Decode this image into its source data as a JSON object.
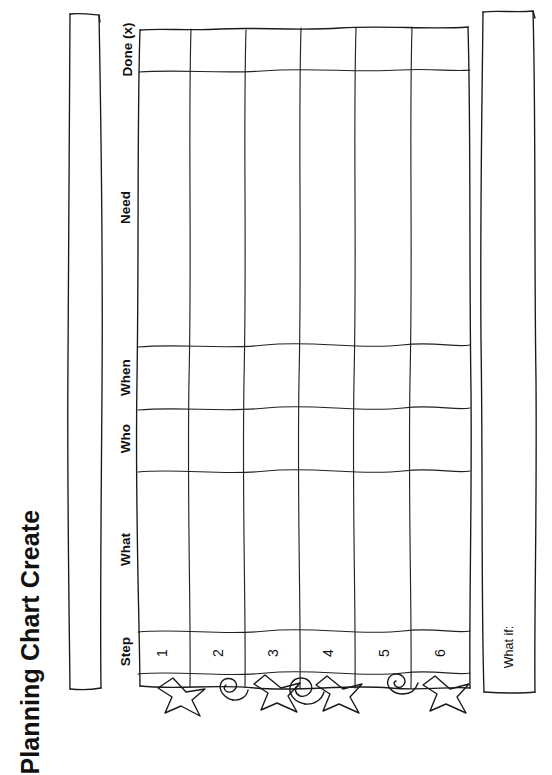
{
  "document": {
    "title": "Planning Chart Create",
    "orientation": "rotated-90"
  },
  "notes_box": {
    "name": "blank-notes-box",
    "content": ""
  },
  "table": {
    "columns": [
      {
        "id": "step",
        "label": "Step"
      },
      {
        "id": "what",
        "label": "What"
      },
      {
        "id": "who",
        "label": "Who"
      },
      {
        "id": "when",
        "label": "When"
      },
      {
        "id": "need",
        "label": "Need"
      },
      {
        "id": "done",
        "label": "Done (x)"
      }
    ],
    "rows": [
      {
        "number": "1",
        "step": "",
        "what": "",
        "who": "",
        "when": "",
        "need": "",
        "done": ""
      },
      {
        "number": "2",
        "step": "",
        "what": "",
        "who": "",
        "when": "",
        "need": "",
        "done": ""
      },
      {
        "number": "3",
        "step": "",
        "what": "",
        "who": "",
        "when": "",
        "need": "",
        "done": ""
      },
      {
        "number": "4",
        "step": "",
        "what": "",
        "who": "",
        "when": "",
        "need": "",
        "done": ""
      },
      {
        "number": "5",
        "step": "",
        "what": "",
        "who": "",
        "when": "",
        "need": "",
        "done": ""
      },
      {
        "number": "6",
        "step": "",
        "what": "",
        "who": "",
        "when": "",
        "need": "",
        "done": ""
      }
    ]
  },
  "what_if": {
    "label": "What if:",
    "content": ""
  },
  "doodles": [
    {
      "index": 0,
      "shape": "star"
    },
    {
      "index": 1,
      "shape": "spiral"
    },
    {
      "index": 2,
      "shape": "star"
    },
    {
      "index": 3,
      "shape": "spiral"
    },
    {
      "index": 4,
      "shape": "star"
    },
    {
      "index": 5,
      "shape": "spiral-small"
    },
    {
      "index": 6,
      "shape": "star"
    }
  ],
  "colors": {
    "ink": "#1a1a1a",
    "paper": "#ffffff",
    "text": "#111111"
  }
}
